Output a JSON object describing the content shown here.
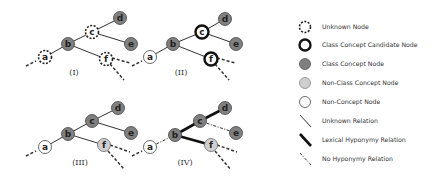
{
  "panels": [
    {
      "label": "(I)",
      "nodes": {
        "a": "unknown",
        "b": "class",
        "c": "unknown",
        "d": "class",
        "e": "class",
        "f": "unknown"
      },
      "edges": {
        "a-b": "unknown",
        "b-c": "unknown",
        "c-d": "unknown",
        "c-e": "unknown",
        "b-f": "unknown"
      }
    },
    {
      "label": "(II)",
      "nodes": {
        "a": "non-concept",
        "b": "class",
        "c": "candidate",
        "d": "class",
        "e": "class",
        "f": "candidate"
      },
      "edges": {
        "a-b": "unknown",
        "b-c": "unknown",
        "c-d": "unknown",
        "c-e": "unknown",
        "b-f": "unknown"
      }
    },
    {
      "label": "(III)",
      "nodes": {
        "a": "non-concept",
        "b": "class",
        "c": "class",
        "d": "class",
        "e": "class",
        "f": "non-class"
      },
      "edges": {
        "a-b": "unknown",
        "b-c": "unknown",
        "c-d": "unknown",
        "c-e": "unknown",
        "b-f": "unknown"
      }
    },
    {
      "label": "(IV)",
      "nodes": {
        "a": "non-concept",
        "b": "class",
        "c": "class",
        "d": "class",
        "e": "class",
        "f": "non-class"
      },
      "edges": {
        "a-b": "no-hyponymy",
        "b-c": "lexical-hyponymy",
        "c-d": "lexical-hyponymy",
        "c-e": "no-hyponymy",
        "b-f": "lexical-hyponymy"
      }
    }
  ],
  "node_labels": [
    "a",
    "b",
    "c",
    "d",
    "e",
    "f"
  ],
  "legend": {
    "items": [
      {
        "kind": "unknown-node",
        "label": "Unknown Node"
      },
      {
        "kind": "candidate-node",
        "label": "Class Concept Candidate Node"
      },
      {
        "kind": "class-node",
        "label": "Class Concept Node"
      },
      {
        "kind": "non-class-node",
        "label": "Non-Class Concept Node"
      },
      {
        "kind": "non-concept-node",
        "label": "Non-Concept Node"
      },
      {
        "kind": "unknown-relation",
        "label": "Unknown Relation"
      },
      {
        "kind": "lexical-hyponymy-relation",
        "label": "Lexical Hyponymy Relation"
      },
      {
        "kind": "no-hyponymy-relation",
        "label": "No Hyponymy Relation"
      }
    ]
  },
  "colors": {
    "class_fill": "#808080",
    "non_class_fill": "#cfcfcf",
    "white_fill": "#ffffff",
    "stroke": "#222222",
    "edge": "#333333"
  }
}
